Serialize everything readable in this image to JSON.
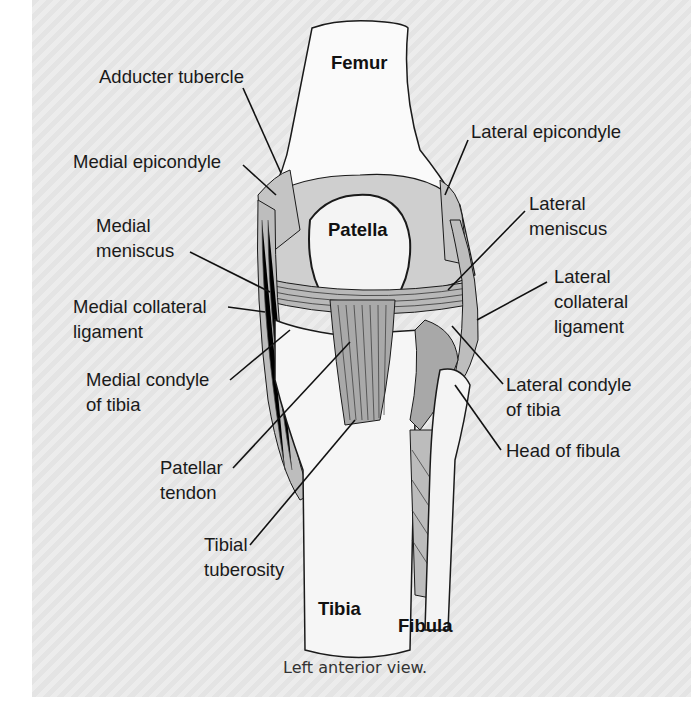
{
  "diagram": {
    "caption": "Left anterior view.",
    "bone_labels": {
      "femur": "Femur",
      "patella": "Patella",
      "tibia": "Tibia",
      "fibula": "Fibula"
    },
    "left_labels": {
      "adducter_tubercle": "Adducter tubercle",
      "medial_epicondyle": "Medial epicondyle",
      "medial_meniscus_1": "Medial",
      "medial_meniscus_2": "meniscus",
      "medial_collateral_1": "Medial collateral",
      "medial_collateral_2": "ligament",
      "medial_condyle_1": "Medial condyle",
      "medial_condyle_2": "of tibia",
      "patellar_tendon_1": "Patellar",
      "patellar_tendon_2": "tendon",
      "tibial_tuberosity_1": "Tibial",
      "tibial_tuberosity_2": "tuberosity"
    },
    "right_labels": {
      "lateral_epicondyle": "Lateral epicondyle",
      "lateral_meniscus_1": "Lateral",
      "lateral_meniscus_2": "meniscus",
      "lateral_collateral_1": "Lateral",
      "lateral_collateral_2": "collateral",
      "lateral_collateral_3": "ligament",
      "lateral_condyle_1": "Lateral condyle",
      "lateral_condyle_2": "of tibia",
      "head_of_fibula": "Head of fibula"
    },
    "colors": {
      "background_stripe_a": "#e4e4e4",
      "background_stripe_b": "#ececec",
      "bone": "#ffffff",
      "shading": "#c8c8c8",
      "ligament": "#b5b5b5",
      "line": "#1a1a1a"
    }
  }
}
